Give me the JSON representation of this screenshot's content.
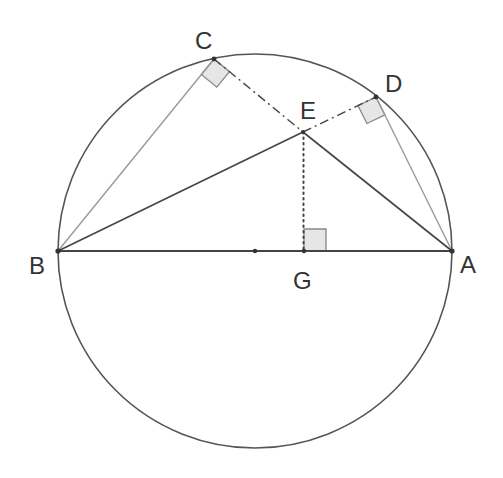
{
  "diagram": {
    "type": "geometry-construction",
    "colors": {
      "circle": "#555555",
      "dark_line": "#444444",
      "light_line": "#999999",
      "square_fill": "#e6e6e6",
      "square_stroke": "#888888",
      "label": "#333333"
    },
    "circle": {
      "cx": 255,
      "cy": 251,
      "r": 197
    },
    "points": {
      "A": {
        "label": "A",
        "x": 452,
        "y": 251,
        "label_x": 460,
        "label_y": 273
      },
      "B": {
        "label": "B",
        "x": 58,
        "y": 251,
        "label_x": 29,
        "label_y": 274
      },
      "C": {
        "label": "C",
        "x": 214,
        "y": 59,
        "label_x": 195,
        "label_y": 49
      },
      "D": {
        "label": "D",
        "x": 376,
        "y": 97,
        "label_x": 385,
        "label_y": 92
      },
      "E": {
        "label": "E",
        "x": 303,
        "y": 132,
        "label_x": 300,
        "label_y": 119
      },
      "G": {
        "label": "G",
        "x": 304,
        "y": 251,
        "label_x": 293,
        "label_y": 289
      },
      "O": {
        "label": "",
        "x": 255,
        "y": 251
      }
    },
    "segments": [
      {
        "name": "AB",
        "from": "A",
        "to": "B",
        "style": "solid-dark"
      },
      {
        "name": "BC",
        "from": "B",
        "to": "C",
        "style": "solid-light"
      },
      {
        "name": "BE",
        "from": "B",
        "to": "E",
        "style": "solid-dark"
      },
      {
        "name": "EA",
        "from": "E",
        "to": "A",
        "style": "solid-dark"
      },
      {
        "name": "AD",
        "from": "A",
        "to": "D",
        "style": "solid-light"
      },
      {
        "name": "CE",
        "from": "C",
        "to": "E",
        "style": "dash-dot"
      },
      {
        "name": "ED",
        "from": "E",
        "to": "D",
        "style": "dash-dot"
      },
      {
        "name": "EG",
        "from": "E",
        "to": "G",
        "style": "dotted"
      }
    ],
    "right_angles": [
      {
        "at": "C",
        "between": [
          "B",
          "E"
        ]
      },
      {
        "at": "D",
        "between": [
          "A",
          "E"
        ]
      },
      {
        "at": "G",
        "between": [
          "E",
          "A"
        ]
      }
    ]
  }
}
